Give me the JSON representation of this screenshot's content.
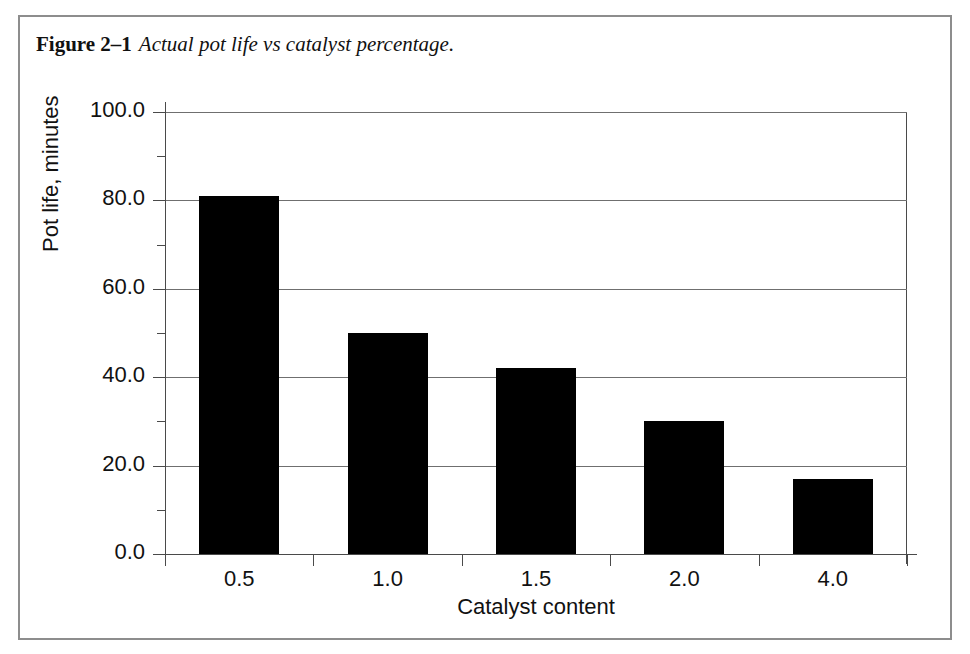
{
  "figure": {
    "label": "Figure 2–1",
    "caption": "Actual pot life vs catalyst percentage."
  },
  "chart_data": {
    "type": "bar",
    "title": "",
    "categories": [
      "0.5",
      "1.0",
      "1.5",
      "2.0",
      "4.0"
    ],
    "values": [
      81,
      50,
      42,
      30,
      17
    ],
    "xlabel": "Catalyst content",
    "ylabel": "Pot life, minutes",
    "ylim": [
      0,
      100
    ],
    "y_major_ticks": [
      "0.0",
      "20.0",
      "40.0",
      "60.0",
      "80.0",
      "100.0"
    ],
    "y_major_values": [
      0,
      20,
      40,
      60,
      80,
      100
    ],
    "y_minor_values": [
      10,
      30,
      50,
      70,
      90
    ],
    "grid": true,
    "grid_axis": "y",
    "legend": false,
    "bar_color": "#000000",
    "axis_color": "#4a4a4a",
    "grid_color": "#6f6f6f",
    "frame_color": "#8d8d8d"
  }
}
